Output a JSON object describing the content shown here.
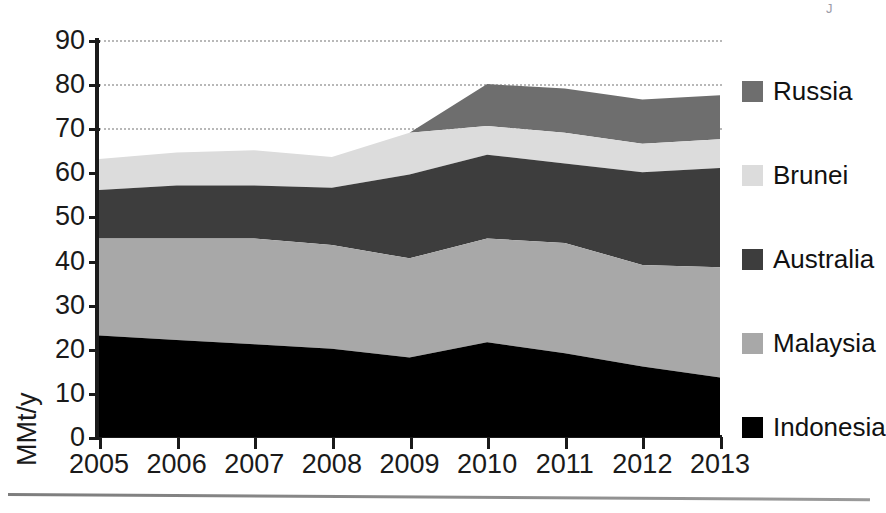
{
  "chart_data": {
    "type": "area",
    "stacked": true,
    "title": "",
    "xlabel": "",
    "ylabel": "MMt/y",
    "x": [
      2005,
      2006,
      2007,
      2008,
      2009,
      2010,
      2011,
      2012,
      2013
    ],
    "categories": [
      "2005",
      "2006",
      "2007",
      "2008",
      "2009",
      "2010",
      "2011",
      "2012",
      "2013"
    ],
    "xtick_labels": [
      "2005",
      "2006",
      "2007",
      "2008",
      "2009",
      "2010",
      "2011",
      "2012",
      "2013"
    ],
    "ytick_labels": [
      "0",
      "10",
      "20",
      "30",
      "40",
      "50",
      "60",
      "70",
      "80",
      "90"
    ],
    "yticks": [
      0,
      10,
      20,
      30,
      40,
      50,
      60,
      70,
      80,
      90
    ],
    "ylim": [
      0,
      90
    ],
    "xlim": [
      2005,
      2013
    ],
    "grid": "dotted horizontal gridlines at 70, 80 and 90",
    "gridlines": [
      70,
      80,
      90
    ],
    "legend_position": "right",
    "stack_order_bottom_to_top": [
      "Indonesia",
      "Malaysia",
      "Australia",
      "Brunei",
      "Russia"
    ],
    "series": [
      {
        "name": "Indonesia",
        "color": "#000000",
        "values": [
          23,
          22,
          21,
          20,
          18,
          21.5,
          19,
          16,
          13.5
        ],
        "cumulative_top": [
          23,
          22,
          21,
          20,
          18,
          21.5,
          19,
          16,
          13.5
        ]
      },
      {
        "name": "Malaysia",
        "color": "#a8a8a8",
        "values": [
          22,
          23,
          24,
          23.5,
          22.5,
          23.5,
          25,
          23,
          25
        ],
        "cumulative_top": [
          45,
          45,
          45,
          43.5,
          40.5,
          45,
          44,
          39,
          38.5
        ]
      },
      {
        "name": "Australia",
        "color": "#3d3d3d",
        "values": [
          11,
          12,
          12,
          13,
          19,
          19,
          18,
          21,
          22.5
        ],
        "cumulative_top": [
          56,
          57,
          57,
          56.5,
          59.5,
          64,
          62,
          60,
          61
        ]
      },
      {
        "name": "Brunei",
        "color": "#dcdcdc",
        "values": [
          7,
          7.5,
          8,
          7,
          9.5,
          6.5,
          7,
          6.5,
          6.5
        ],
        "cumulative_top": [
          63,
          64.5,
          65,
          63.5,
          69,
          70.5,
          69,
          66.5,
          67.5
        ]
      },
      {
        "name": "Russia",
        "color": "#6e6e6e",
        "values": [
          0,
          0,
          0,
          0,
          0,
          9.5,
          10,
          10,
          10
        ],
        "cumulative_top": [
          63,
          64.5,
          65,
          63.5,
          69,
          80,
          79,
          76.5,
          77.5
        ]
      }
    ],
    "totals": [
      63,
      64.5,
      65,
      63.5,
      69,
      80,
      79,
      76.5,
      77.5
    ]
  },
  "axis": {
    "y_title": "MMt/y"
  },
  "legend": {
    "items": [
      {
        "label": "Russia",
        "color": "#6e6e6e"
      },
      {
        "label": "Brunei",
        "color": "#dcdcdc"
      },
      {
        "label": "Australia",
        "color": "#3d3d3d"
      },
      {
        "label": "Malaysia",
        "color": "#a8a8a8"
      },
      {
        "label": "Indonesia",
        "color": "#000000"
      }
    ]
  },
  "artifact": {
    "mark": "J"
  }
}
